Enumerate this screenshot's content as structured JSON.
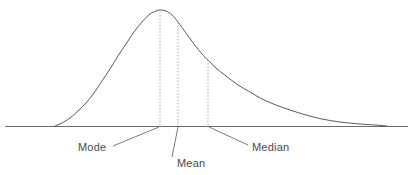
{
  "figure": {
    "background_color": "#ffffff",
    "width": 412,
    "height": 175
  },
  "style": {
    "curve_color": "#5a5a5a",
    "axis_color": "#6b6b6b",
    "dotted_color": "#a0a0a0",
    "leader_color": "#6b6b6b",
    "text_color": "#4a4a4a",
    "font_size": "11px"
  },
  "chart_data": {
    "type": "line",
    "title": "",
    "subtitle": "",
    "xlabel": "",
    "ylabel": "",
    "grid": false,
    "legend_position": "none",
    "axis": {
      "baseline_y": 126,
      "x_start": 5,
      "x_end": 408,
      "visible": true,
      "ticks": [],
      "tick_labels": []
    },
    "xlim": [
      5,
      408
    ],
    "ylim": [
      0,
      126
    ],
    "series": [
      {
        "name": "density",
        "curve_type": "skewed-normal",
        "points": [
          [
            55,
            126
          ],
          [
            62,
            123
          ],
          [
            70,
            118
          ],
          [
            78,
            111
          ],
          [
            86,
            103
          ],
          [
            94,
            93
          ],
          [
            102,
            81
          ],
          [
            110,
            69
          ],
          [
            118,
            56
          ],
          [
            126,
            44
          ],
          [
            134,
            32
          ],
          [
            142,
            22
          ],
          [
            150,
            14
          ],
          [
            156,
            11
          ],
          [
            160,
            10
          ],
          [
            166,
            11
          ],
          [
            172,
            15
          ],
          [
            178,
            22
          ],
          [
            186,
            33
          ],
          [
            194,
            44
          ],
          [
            202,
            54
          ],
          [
            208,
            60
          ],
          [
            216,
            68
          ],
          [
            226,
            76
          ],
          [
            238,
            85
          ],
          [
            250,
            92
          ],
          [
            262,
            99
          ],
          [
            276,
            105
          ],
          [
            290,
            110
          ],
          [
            306,
            115
          ],
          [
            322,
            119
          ],
          [
            340,
            122
          ],
          [
            360,
            124
          ],
          [
            375,
            125
          ],
          [
            387,
            126
          ]
        ]
      }
    ],
    "markers": [
      {
        "name": "mode",
        "label": "Mode",
        "x": 160,
        "curve_y": 12,
        "baseline_y": 126,
        "dotted": true,
        "label_x": 78,
        "label_y": 151,
        "leader_from": [
          113,
          146
        ],
        "leader_to": [
          159,
          127
        ]
      },
      {
        "name": "mean",
        "label": "Mean",
        "x": 178,
        "curve_y": 23,
        "baseline_y": 126,
        "dotted": true,
        "label_x": 177,
        "label_y": 167,
        "leader_from": [
          178,
          127
        ],
        "leader_to": [
          172,
          157
        ]
      },
      {
        "name": "median",
        "label": "Median",
        "x": 208,
        "curve_y": 60,
        "baseline_y": 126,
        "dotted": true,
        "label_x": 252,
        "label_y": 151,
        "leader_from": [
          209,
          127
        ],
        "leader_to": [
          248,
          145
        ]
      }
    ]
  },
  "labels": {
    "mode": "Mode",
    "mean": "Mean",
    "median": "Median"
  }
}
